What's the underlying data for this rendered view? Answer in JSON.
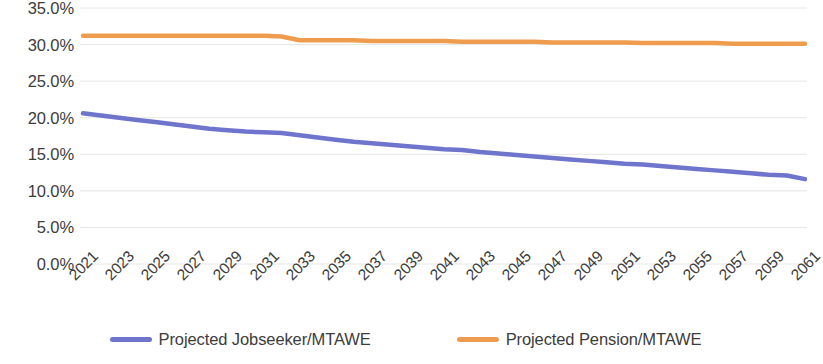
{
  "chart_data": {
    "type": "line",
    "title": "",
    "xlabel": "",
    "ylabel": "",
    "grid": true,
    "legend_position": "bottom",
    "ylim": [
      0,
      35
    ],
    "y_ticks": [
      "0.0%",
      "5.0%",
      "10.0%",
      "15.0%",
      "20.0%",
      "25.0%",
      "30.0%",
      "35.0%"
    ],
    "y_tick_values": [
      0,
      5,
      10,
      15,
      20,
      25,
      30,
      35
    ],
    "x_tick_labels": [
      "2021",
      "2023",
      "2025",
      "2027",
      "2029",
      "2031",
      "2033",
      "2035",
      "2037",
      "2039",
      "2041",
      "2043",
      "2045",
      "2047",
      "2049",
      "2051",
      "2053",
      "2055",
      "2057",
      "2059",
      "2061"
    ],
    "x": [
      2021,
      2022,
      2023,
      2024,
      2025,
      2026,
      2027,
      2028,
      2029,
      2030,
      2031,
      2032,
      2033,
      2034,
      2035,
      2036,
      2037,
      2038,
      2039,
      2040,
      2041,
      2042,
      2043,
      2044,
      2045,
      2046,
      2047,
      2048,
      2049,
      2050,
      2051,
      2052,
      2053,
      2054,
      2055,
      2056,
      2057,
      2058,
      2059,
      2060,
      2061
    ],
    "series": [
      {
        "name": "Projected Jobseeker/MTAWE",
        "color": "#6f74cc",
        "values": [
          20.6,
          20.3,
          20.0,
          19.7,
          19.4,
          19.1,
          18.8,
          18.5,
          18.3,
          18.1,
          18.0,
          17.9,
          17.6,
          17.3,
          17.0,
          16.7,
          16.5,
          16.3,
          16.1,
          15.9,
          15.7,
          15.6,
          15.3,
          15.1,
          14.9,
          14.7,
          14.5,
          14.3,
          14.1,
          13.9,
          13.7,
          13.6,
          13.4,
          13.2,
          13.0,
          12.8,
          12.6,
          12.4,
          12.2,
          12.1,
          11.6
        ]
      },
      {
        "name": "Projected Pension/MTAWE",
        "color": "#ef9c4e",
        "values": [
          31.2,
          31.2,
          31.2,
          31.2,
          31.2,
          31.2,
          31.2,
          31.2,
          31.2,
          31.2,
          31.2,
          31.1,
          30.6,
          30.6,
          30.6,
          30.6,
          30.5,
          30.5,
          30.5,
          30.5,
          30.5,
          30.4,
          30.4,
          30.4,
          30.4,
          30.4,
          30.3,
          30.3,
          30.3,
          30.3,
          30.3,
          30.2,
          30.2,
          30.2,
          30.2,
          30.2,
          30.1,
          30.1,
          30.1,
          30.1,
          30.1
        ]
      }
    ]
  },
  "legend": {
    "items": [
      {
        "label": "Projected Jobseeker/MTAWE",
        "color": "#6f74cc"
      },
      {
        "label": "Projected Pension/MTAWE",
        "color": "#ef9c4e"
      }
    ]
  },
  "colors": {
    "jobseeker_line": "#6f74cc",
    "pension_line": "#ef9c4e",
    "gridline": "#e6e6e6",
    "text": "#3c3c3c",
    "background": "#ffffff"
  }
}
